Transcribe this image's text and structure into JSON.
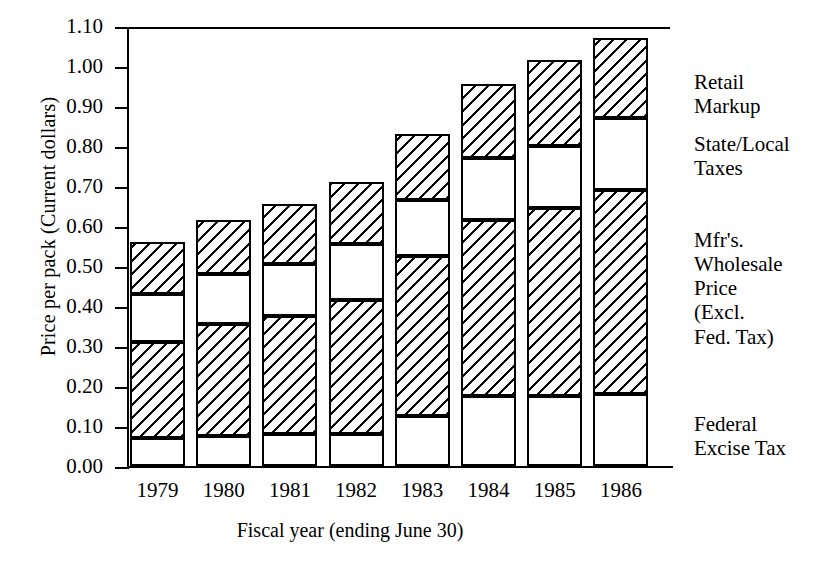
{
  "chart_data": {
    "type": "bar",
    "stacked": true,
    "title": "",
    "xlabel": "Fiscal year (ending June 30)",
    "ylabel": "Price per pack (Current dollars)",
    "categories": [
      "1979",
      "1980",
      "1981",
      "1982",
      "1983",
      "1984",
      "1985",
      "1986"
    ],
    "ylim": [
      0.0,
      1.1
    ],
    "ytick_labels": [
      "1.10",
      "1.00",
      "0.90",
      "0.80",
      "0.70",
      "0.60",
      "0.50",
      "0.40",
      "0.30",
      "0.20",
      "0.10",
      "0.00"
    ],
    "ytick_values": [
      1.1,
      1.0,
      0.9,
      0.8,
      0.7,
      0.6,
      0.5,
      0.4,
      0.3,
      0.2,
      0.1,
      0.0
    ],
    "grid": false,
    "legend_position": "right-of-bars",
    "series": [
      {
        "name": "Federal Excise Tax",
        "fill": "plain",
        "values": [
          0.07,
          0.075,
          0.08,
          0.08,
          0.125,
          0.175,
          0.175,
          0.18
        ]
      },
      {
        "name": "Mfr's. Wholesale Price (Excl. Fed. Tax)",
        "fill": "hatch",
        "values": [
          0.24,
          0.28,
          0.295,
          0.335,
          0.4,
          0.44,
          0.47,
          0.51
        ]
      },
      {
        "name": "State/Local Taxes",
        "fill": "plain",
        "values": [
          0.12,
          0.125,
          0.13,
          0.14,
          0.14,
          0.155,
          0.155,
          0.18
        ]
      },
      {
        "name": "Retail Markup",
        "fill": "hatch",
        "values": [
          0.13,
          0.135,
          0.15,
          0.155,
          0.165,
          0.185,
          0.215,
          0.2
        ]
      }
    ],
    "totals": [
      0.56,
      0.615,
      0.655,
      0.71,
      0.83,
      0.955,
      1.015,
      1.07
    ],
    "cumulative_tops": [
      {
        "year": "1979",
        "federal": 0.07,
        "wholesale": 0.31,
        "state_local": 0.43,
        "retail": 0.56
      },
      {
        "year": "1980",
        "federal": 0.075,
        "wholesale": 0.355,
        "state_local": 0.48,
        "retail": 0.615
      },
      {
        "year": "1981",
        "federal": 0.08,
        "wholesale": 0.375,
        "state_local": 0.505,
        "retail": 0.655
      },
      {
        "year": "1982",
        "federal": 0.08,
        "wholesale": 0.415,
        "state_local": 0.555,
        "retail": 0.71
      },
      {
        "year": "1983",
        "federal": 0.125,
        "wholesale": 0.525,
        "state_local": 0.665,
        "retail": 0.83
      },
      {
        "year": "1984",
        "federal": 0.175,
        "wholesale": 0.615,
        "state_local": 0.77,
        "retail": 0.955
      },
      {
        "year": "1985",
        "federal": 0.175,
        "wholesale": 0.645,
        "state_local": 0.8,
        "retail": 1.015
      },
      {
        "year": "1986",
        "federal": 0.18,
        "wholesale": 0.69,
        "state_local": 0.87,
        "retail": 1.07
      }
    ]
  },
  "legend": {
    "entries": [
      {
        "lines": [
          "Retail",
          "Markup"
        ]
      },
      {
        "lines": [
          "State/Local",
          "Taxes"
        ]
      },
      {
        "lines": [
          "Mfr's.",
          "Wholesale",
          "Price",
          "(Excl.",
          "Fed. Tax)"
        ]
      },
      {
        "lines": [
          "Federal",
          "Excise Tax"
        ]
      }
    ]
  }
}
